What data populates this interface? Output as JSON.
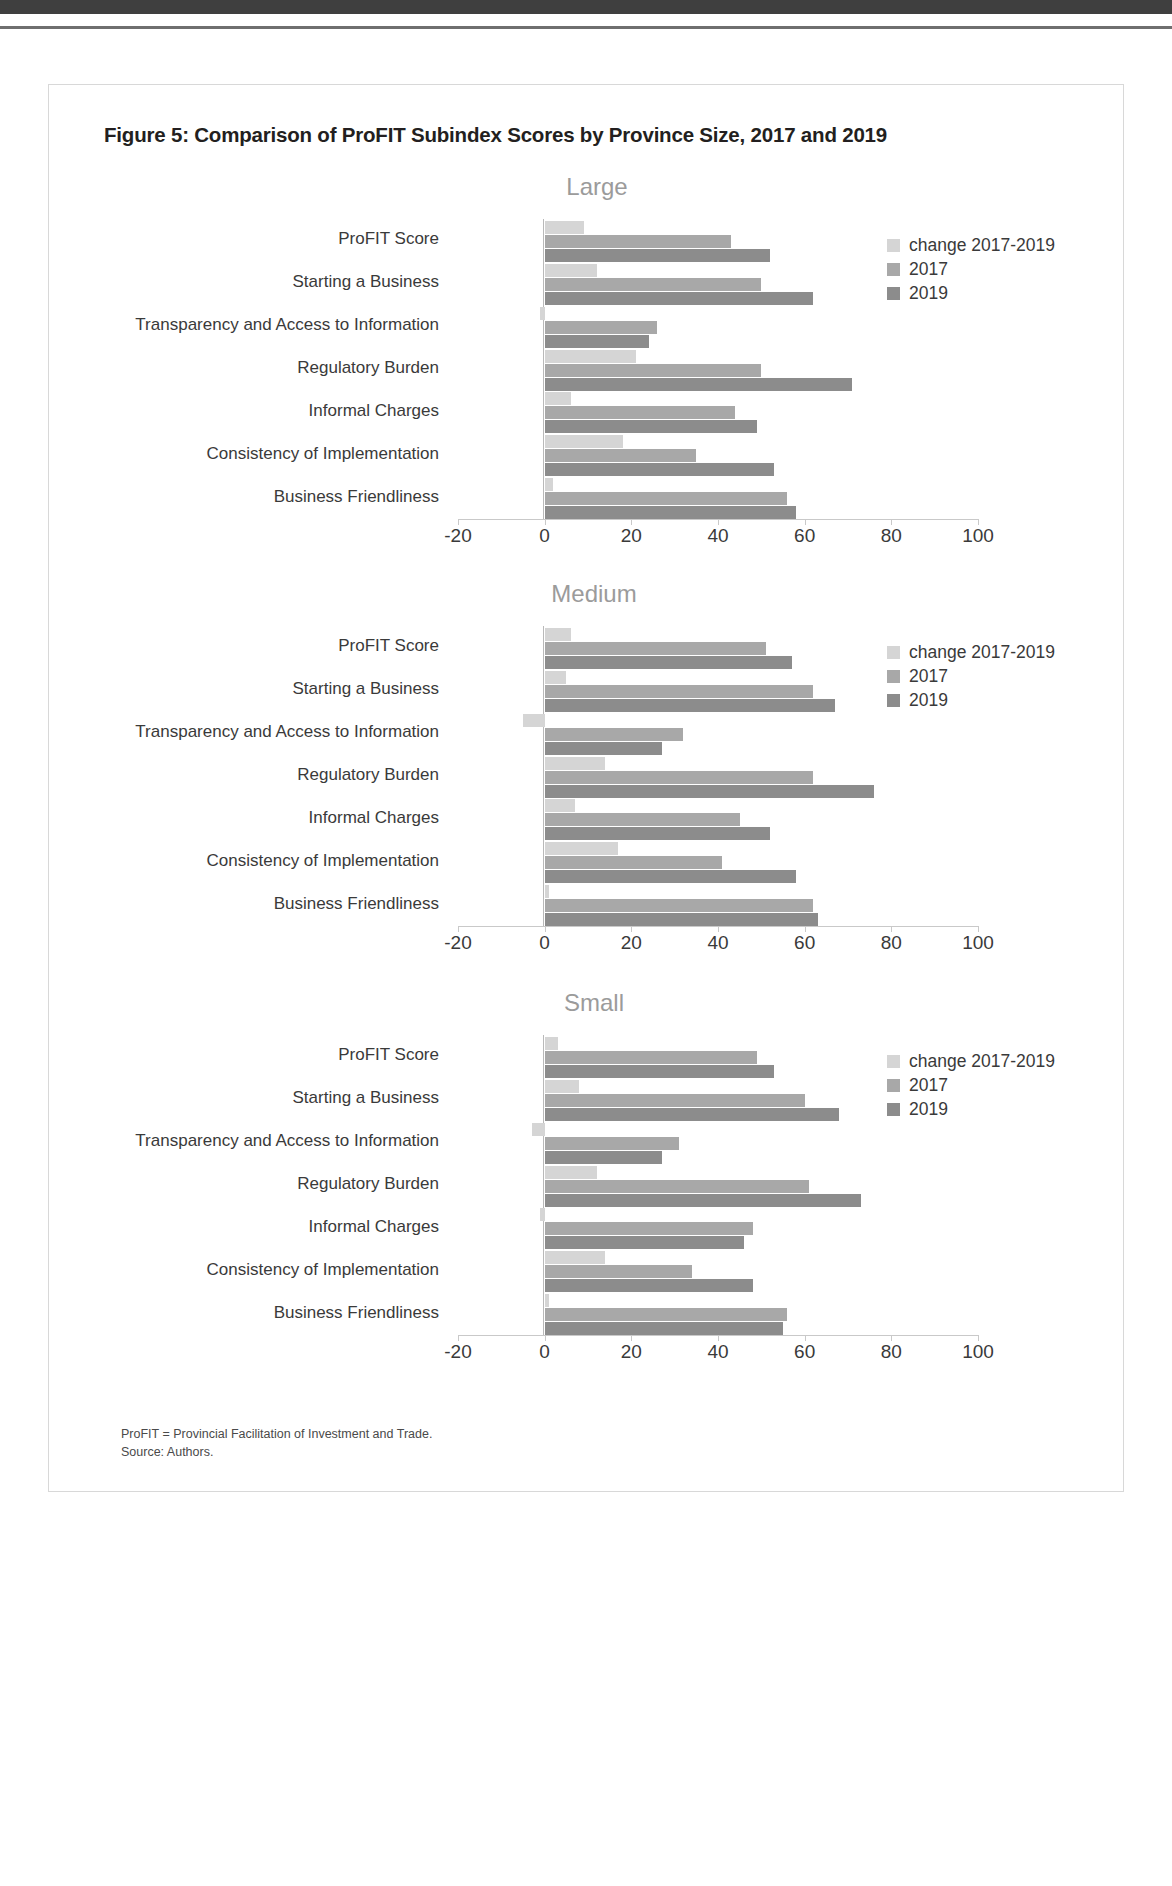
{
  "figure": {
    "title": "Figure 5: Comparison of ProFIT Subindex Scores by Province Size, 2017 and 2019",
    "footnote_1": "ProFIT = Provincial Facilitation of Investment and Trade.",
    "footnote_2": "Source: Authors."
  },
  "colors": {
    "change": "#d5d5d5",
    "y2017": "#a8a8a8",
    "y2019": "#8c8c8c",
    "panel_title": "#9b9b9b",
    "axis": "#c9c9c9"
  },
  "legend": {
    "items": [
      {
        "label": "change 2017-2019",
        "color": "#d5d5d5"
      },
      {
        "label": "2017",
        "color": "#a8a8a8"
      },
      {
        "label": "2019",
        "color": "#8c8c8c"
      }
    ]
  },
  "chart_data": [
    {
      "type": "bar",
      "title": "Large",
      "orientation": "horizontal",
      "xlabel": "",
      "ylabel": "",
      "xlim": [
        -20,
        100
      ],
      "xticks": [
        -20,
        0,
        20,
        40,
        60,
        80,
        100
      ],
      "grid": false,
      "legend_position": "top-right",
      "categories": [
        "ProFIT Score",
        "Starting a Business",
        "Transparency and Access to Information",
        "Regulatory Burden",
        "Informal Charges",
        "Consistency of Implementation",
        "Business Friendliness"
      ],
      "series": [
        {
          "name": "change 2017-2019",
          "values": [
            9,
            12,
            -1,
            21,
            6,
            18,
            2
          ]
        },
        {
          "name": "2017",
          "values": [
            43,
            50,
            26,
            50,
            44,
            35,
            56
          ]
        },
        {
          "name": "2019",
          "values": [
            52,
            62,
            24,
            71,
            49,
            53,
            58
          ]
        }
      ]
    },
    {
      "type": "bar",
      "title": "Medium",
      "orientation": "horizontal",
      "xlabel": "",
      "ylabel": "",
      "xlim": [
        -20,
        100
      ],
      "xticks": [
        -20,
        0,
        20,
        40,
        60,
        80,
        100
      ],
      "grid": false,
      "legend_position": "top-right",
      "categories": [
        "ProFIT Score",
        "Starting a Business",
        "Transparency and Access to Information",
        "Regulatory Burden",
        "Informal Charges",
        "Consistency of Implementation",
        "Business Friendliness"
      ],
      "series": [
        {
          "name": "change 2017-2019",
          "values": [
            6,
            5,
            -5,
            14,
            7,
            17,
            1
          ]
        },
        {
          "name": "2017",
          "values": [
            51,
            62,
            32,
            62,
            45,
            41,
            62
          ]
        },
        {
          "name": "2019",
          "values": [
            57,
            67,
            27,
            76,
            52,
            58,
            63
          ]
        }
      ]
    },
    {
      "type": "bar",
      "title": "Small",
      "orientation": "horizontal",
      "xlabel": "",
      "ylabel": "",
      "xlim": [
        -20,
        100
      ],
      "xticks": [
        -20,
        0,
        20,
        40,
        60,
        80,
        100
      ],
      "grid": false,
      "legend_position": "top-right",
      "categories": [
        "ProFIT Score",
        "Starting a Business",
        "Transparency and Access to Information",
        "Regulatory Burden",
        "Informal Charges",
        "Consistency of Implementation",
        "Business Friendliness"
      ],
      "series": [
        {
          "name": "change 2017-2019",
          "values": [
            3,
            8,
            -3,
            12,
            -1,
            14,
            1
          ]
        },
        {
          "name": "2017",
          "values": [
            49,
            60,
            31,
            61,
            48,
            34,
            56
          ]
        },
        {
          "name": "2019",
          "values": [
            53,
            68,
            27,
            73,
            46,
            48,
            55
          ]
        }
      ]
    }
  ]
}
